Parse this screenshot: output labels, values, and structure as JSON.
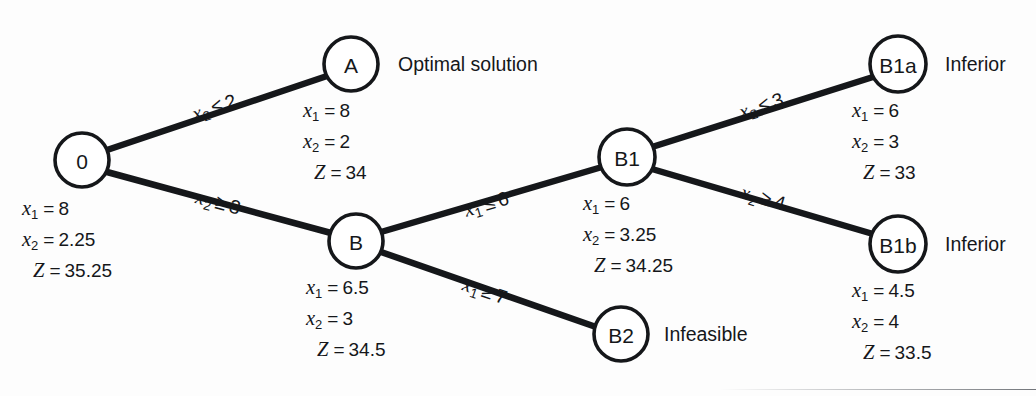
{
  "figure": {
    "type": "branch-and-bound-tree",
    "background_color": "#fdfdfd",
    "line_color": "#15171a"
  },
  "nodes": [
    {
      "id": "root",
      "label": "0",
      "cx": 82,
      "cy": 160,
      "r": 27,
      "status": "",
      "values": {
        "x1": "8",
        "x2": "2.25",
        "z": "35.25"
      },
      "values_x": 22,
      "values_y": 193
    },
    {
      "id": "A",
      "label": "A",
      "cx": 351,
      "cy": 64,
      "r": 27,
      "status": "Optimal solution",
      "status_x": 398,
      "status_y": 53,
      "values": {
        "x1": "8",
        "x2": "2",
        "z": "34"
      },
      "values_x": 303,
      "values_y": 95
    },
    {
      "id": "B",
      "label": "B",
      "cx": 356,
      "cy": 241,
      "r": 27,
      "status": "",
      "values": {
        "x1": "6.5",
        "x2": "3",
        "z": "34.5"
      },
      "values_x": 306,
      "values_y": 272
    },
    {
      "id": "B1",
      "label": "B1",
      "cx": 627,
      "cy": 157,
      "r": 28,
      "status": "",
      "values": {
        "x1": "6",
        "x2": "3.25",
        "z": "34.25"
      },
      "values_x": 583,
      "values_y": 188
    },
    {
      "id": "B2",
      "label": "B2",
      "cx": 621,
      "cy": 334,
      "r": 27,
      "status": "Infeasible",
      "status_x": 664,
      "status_y": 323,
      "values": null
    },
    {
      "id": "B1a",
      "label": "B1a",
      "cx": 898,
      "cy": 64,
      "r": 28,
      "status": "Inferior",
      "status_x": 945,
      "status_y": 53,
      "values": {
        "x1": "6",
        "x2": "3",
        "z": "33"
      },
      "values_x": 852,
      "values_y": 95
    },
    {
      "id": "B1b",
      "label": "B1b",
      "cx": 898,
      "cy": 244,
      "r": 28,
      "status": "Inferior",
      "status_x": 945,
      "status_y": 233,
      "values": {
        "x1": "4.5",
        "x2": "4",
        "z": "33.5"
      },
      "values_x": 852,
      "values_y": 275
    }
  ],
  "edges": [
    {
      "id": "root-A",
      "from": "root",
      "to": "A",
      "x1": 107,
      "y1": 150,
      "x2": 327,
      "y2": 76,
      "label": {
        "var": "x",
        "sub": "2",
        "rel": "≤",
        "value": "2"
      },
      "label_x": 193,
      "label_y": 103,
      "label_rotate": -18.5
    },
    {
      "id": "root-B",
      "from": "root",
      "to": "B",
      "x1": 107,
      "y1": 172,
      "x2": 331,
      "y2": 233,
      "label": {
        "var": "x",
        "sub": "2",
        "rel": "≥",
        "value": "3"
      },
      "label_x": 196,
      "label_y": 185,
      "label_rotate": 15.2
    },
    {
      "id": "B-B1",
      "from": "B",
      "to": "B1",
      "x1": 381,
      "y1": 232,
      "x2": 602,
      "y2": 167,
      "label": {
        "var": "x",
        "sub": "1",
        "rel": "≤",
        "value": "6"
      },
      "label_x": 465,
      "label_y": 199,
      "label_rotate": -16.5
    },
    {
      "id": "B-B2",
      "from": "B",
      "to": "B2",
      "x1": 381,
      "y1": 252,
      "x2": 596,
      "y2": 327,
      "label": {
        "var": "x",
        "sub": "1",
        "rel": "≥",
        "value": "7"
      },
      "label_x": 463,
      "label_y": 272,
      "label_rotate": 19.0
    },
    {
      "id": "B1-B1a",
      "from": "B1",
      "to": "B1a",
      "x1": 652,
      "y1": 147,
      "x2": 873,
      "y2": 77,
      "label": {
        "var": "x",
        "sub": "2",
        "rel": "≤",
        "value": "3"
      },
      "label_x": 740,
      "label_y": 101,
      "label_rotate": -17.6
    },
    {
      "id": "B1-B1b",
      "from": "B1",
      "to": "B1b",
      "x1": 652,
      "y1": 169,
      "x2": 873,
      "y2": 234,
      "label": {
        "var": "x",
        "sub": "2",
        "rel": "≥",
        "value": "4"
      },
      "label_x": 741,
      "label_y": 180,
      "label_rotate": 16.4
    }
  ],
  "symbols": {
    "equals": "=",
    "z_symbol": "Z",
    "x_symbol": "x"
  }
}
